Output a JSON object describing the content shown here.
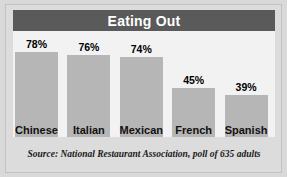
{
  "chart_data": {
    "type": "bar",
    "title": "Eating Out",
    "categories": [
      "Chinese",
      "Italian",
      "Mexican",
      "French",
      "Spanish"
    ],
    "values": [
      78,
      76,
      74,
      45,
      39
    ],
    "value_labels": [
      "78%",
      "76%",
      "74%",
      "45%",
      "39%"
    ],
    "xlabel": "",
    "ylabel": "",
    "ylim": [
      0,
      100
    ],
    "grid": false,
    "legend": null,
    "source": "Source: National Restaurant Association, poll of 635 adults",
    "colors": {
      "bar": "#b6b6b6",
      "header_bg": "#5a5a5a",
      "header_text": "#ffffff",
      "plot_bg": "#f2f2f2",
      "page_bg": "#dcdcdc",
      "label_text": "#111111"
    }
  }
}
